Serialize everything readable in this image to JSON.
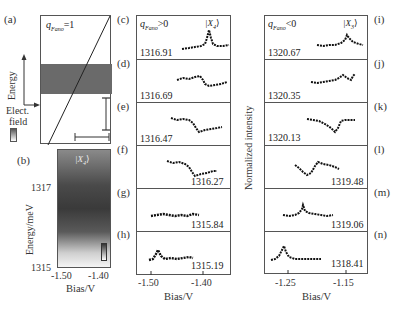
{
  "panel_labels": {
    "a": "(a)",
    "b": "(b)",
    "c": "(c)",
    "d": "(d)",
    "e": "(e)",
    "f": "(f)",
    "g": "(g)",
    "h": "(h)",
    "i": "(i)",
    "j": "(j)",
    "k": "(k)",
    "l": "(l)",
    "m": "(m)",
    "n": "(n)"
  },
  "panel_a": {
    "title": "q",
    "title_sub": "Fano",
    "title_suffix": "=1",
    "y_arrow_label": "Energy",
    "x_arrow_label_line1": "Elect.",
    "x_arrow_label_line2": "field"
  },
  "panel_b": {
    "state_label": "|X",
    "state_sub": "4",
    "state_close": "⟩",
    "ylabel": "Energy/meV",
    "xlabel": "Bias/V",
    "yticks": [
      "1317",
      "1315"
    ],
    "xticks": [
      "-1.50",
      "-1.40"
    ]
  },
  "middle": {
    "title": "q",
    "title_sub": "Fano",
    "title_suffix": ">0",
    "state_label": "|X",
    "state_sub": "4",
    "state_close": "⟩",
    "xlabel": "Bias/V",
    "xticks": [
      "-1.50",
      "-1.40"
    ],
    "energies": [
      "1316.91",
      "1316.69",
      "1316.47",
      "1316.27",
      "1315.84",
      "1315.19"
    ]
  },
  "right": {
    "title": "q",
    "title_sub": "Fano",
    "title_suffix": "<0",
    "state_label": "|X",
    "state_sub": "3",
    "state_close": "⟩",
    "xlabel": "Bias/V",
    "ylabel": "Normalized intensity",
    "xticks": [
      "-1.25",
      "-1.15"
    ],
    "energies": [
      "1320.67",
      "1320.35",
      "1320.13",
      "1319.48",
      "1319.06",
      "1318.41"
    ]
  },
  "chart_data": [
    {
      "type": "heatmap",
      "panel": "(b)",
      "title": "|X4⟩",
      "xlabel": "Bias/V",
      "ylabel": "Energy/meV",
      "xlim": [
        -1.52,
        -1.37
      ],
      "ylim": [
        1315,
        1318.2
      ],
      "xticks": [
        -1.5,
        -1.4
      ],
      "yticks": [
        1317,
        1315
      ],
      "description": "Intensity maximum near 1316.5 meV, fading toward 1315 meV and upper region"
    },
    {
      "type": "line",
      "panel": "(c)-(h)",
      "title": "qFano>0 |X4⟩",
      "xlabel": "Bias/V",
      "xticks": [
        -1.5,
        -1.4
      ],
      "series": [
        {
          "name": "1316.91",
          "shape": "flat with sharp peak near -1.43 V"
        },
        {
          "name": "1316.69",
          "shape": "step down near -1.43 V"
        },
        {
          "name": "1316.47",
          "shape": "high plateau then dip near -1.44 V"
        },
        {
          "name": "1316.27",
          "shape": "high plateau then dip near -1.45 V"
        },
        {
          "name": "1315.84",
          "shape": "noisy flat"
        },
        {
          "name": "1315.19",
          "shape": "small peak near -1.49 V then flat"
        }
      ]
    },
    {
      "type": "line",
      "panel": "(i)-(n)",
      "title": "qFano<0 |X3⟩",
      "xlabel": "Bias/V",
      "ylabel": "Normalized intensity",
      "xticks": [
        -1.25,
        -1.15
      ],
      "series": [
        {
          "name": "1320.67",
          "shape": "flat then peak near -1.15 V"
        },
        {
          "name": "1320.35",
          "shape": "rising with peak near -1.16 V"
        },
        {
          "name": "1320.13",
          "shape": "dip near -1.17 V then rise"
        },
        {
          "name": "1319.48",
          "shape": "dip near -1.23 V then peak near -1.21 V"
        },
        {
          "name": "1319.06",
          "shape": "sharp peak near -1.21 V"
        },
        {
          "name": "1318.41",
          "shape": "sharp peak near -1.26 V then flat"
        }
      ]
    }
  ]
}
